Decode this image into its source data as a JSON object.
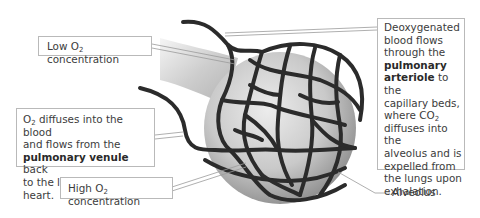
{
  "diagram": {
    "labels": {
      "low_o2": {
        "prefix": "Low O",
        "sub": "2",
        "suffix": " concentration"
      },
      "high_o2": {
        "prefix": "High O",
        "sub": "2",
        "suffix": " concentration"
      },
      "venule": {
        "prefix": "O",
        "sub": "2",
        "line1_rest": " diffuses into the blood",
        "line2": "and flows from the",
        "bold": "pulmonary venule",
        "line3_rest": " back",
        "line4": "to the left side of the heart."
      },
      "arteriole": {
        "line1": "Deoxygenated",
        "line2": "blood flows",
        "line3": "through the",
        "bold1": "pulmonary",
        "bold2": "arteriole",
        "line5_rest": " to the",
        "line6": "capillary beds,",
        "line7_prefix": "where CO",
        "line7_sub": "2",
        "line8": "diffuses into the",
        "line9": "alveolus and is",
        "line10": "expelled from",
        "line11": "the lungs upon",
        "line12": "exhalation."
      },
      "alveolus": "Alveolus"
    },
    "colors": {
      "capillary": "#2b2b2b",
      "sphere_light": "#e4e4e4",
      "sphere_dark": "#9a9a9a",
      "box_border": "#b9b9b9",
      "leader_line": "#9a9a9a"
    }
  }
}
